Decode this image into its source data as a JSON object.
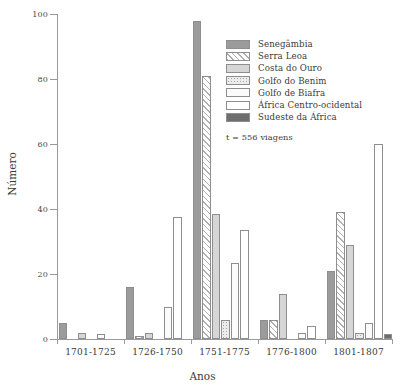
{
  "chart_data": {
    "type": "bar",
    "title": "",
    "subtitle": "",
    "xlabel": "Anos",
    "ylabel": "Número",
    "ylim": [
      0,
      100
    ],
    "yticks": [
      0,
      20,
      40,
      60,
      80,
      100
    ],
    "grid": false,
    "legend_position": "top-right",
    "annotation": "t = 556 viagens",
    "categories": [
      "1701-1725",
      "1726-1750",
      "1751-1775",
      "1776-1800",
      "1801-1807"
    ],
    "series": [
      {
        "name": "Senegâmbia",
        "fill": "solid-gray",
        "color": "#9b9b9b",
        "values": [
          5,
          16,
          98,
          6,
          21
        ]
      },
      {
        "name": "Serra Leoa",
        "fill": "diagonal-hatch",
        "color": "#ffffff",
        "values": [
          0,
          1,
          81,
          6,
          39
        ]
      },
      {
        "name": "Costa do Ouro",
        "fill": "light-gray",
        "color": "#d6d6d6",
        "values": [
          2,
          2,
          38.5,
          14,
          29
        ]
      },
      {
        "name": "Golfo do Benim",
        "fill": "stipple",
        "color": "#ececec",
        "values": [
          0,
          0,
          6,
          0,
          2
        ]
      },
      {
        "name": "Golfo de Biafra",
        "fill": "near-white",
        "color": "#fbfbfb",
        "values": [
          1.5,
          10,
          23.5,
          2,
          5
        ]
      },
      {
        "name": "África Centro-ocidental",
        "fill": "white",
        "color": "#ffffff",
        "values": [
          0,
          37.5,
          33.5,
          4,
          60
        ]
      },
      {
        "name": "Sudeste da África",
        "fill": "dark-gray",
        "color": "#6e6e6e",
        "values": [
          0,
          0,
          0,
          0,
          1.5
        ]
      }
    ]
  }
}
